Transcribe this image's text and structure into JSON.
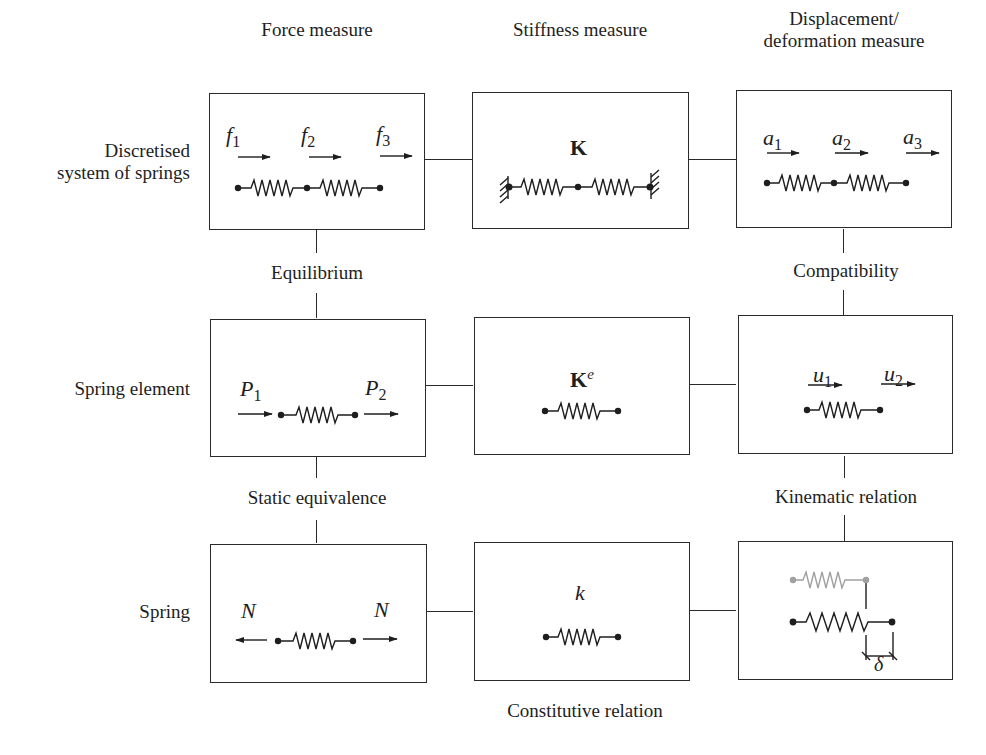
{
  "columns": {
    "force": "Force measure",
    "stiffness": "Stiffness measure",
    "displacement_line1": "Displacement/",
    "displacement_line2": "deformation measure"
  },
  "rows": {
    "system_line1": "Discretised",
    "system_line2": "system of springs",
    "element": "Spring element",
    "spring": "Spring"
  },
  "relations": {
    "equilibrium": "Equilibrium",
    "compatibility": "Compatibility",
    "static_equivalence": "Static equivalence",
    "kinematic_relation": "Kinematic relation",
    "constitutive_relation": "Constitutive relation"
  },
  "symbols": {
    "f": "f",
    "f_subs": [
      "1",
      "2",
      "3"
    ],
    "K": "K",
    "a": "a",
    "a_subs": [
      "1",
      "2",
      "3"
    ],
    "P": "P",
    "P_subs": [
      "1",
      "2"
    ],
    "Ke_base": "K",
    "Ke_sup": "e",
    "u": "u",
    "u_subs": [
      "1",
      "2"
    ],
    "N_left": "N",
    "N_right": "N",
    "k": "k",
    "delta": "δ"
  },
  "colors": {
    "line": "#2a2a2a",
    "ghost_spring": "#a0a0a0"
  }
}
